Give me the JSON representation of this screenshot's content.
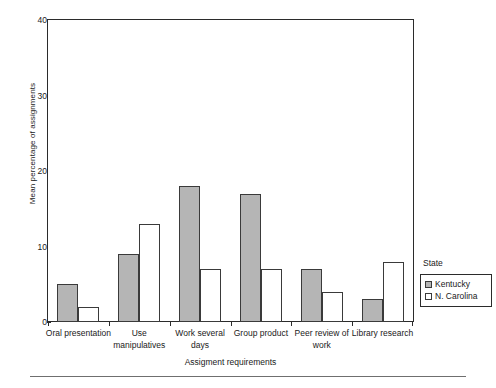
{
  "figure": {
    "clipped_title_fragment": "",
    "background": "#ffffff"
  },
  "chart_data": {
    "type": "bar",
    "title": "",
    "xlabel": "Assigment requirements",
    "ylabel": "Mean percentage of assignments",
    "categories": [
      "Oral presentation",
      "Use manipulatives",
      "Work several days",
      "Group product",
      "Peer review of work",
      "Library research"
    ],
    "series": [
      {
        "name": "Kentucky",
        "color": "#b5b5b5",
        "values": [
          5,
          9,
          18,
          17,
          7,
          3
        ]
      },
      {
        "name": "N. Carolina",
        "color": "#ffffff",
        "values": [
          2,
          13,
          7,
          7,
          4,
          8
        ]
      }
    ],
    "ylim": [
      0,
      40
    ],
    "yticks": [
      0,
      10,
      20,
      30,
      40
    ],
    "ytick_labels": [
      "0",
      "10",
      "20",
      "30",
      "40"
    ],
    "grid": false,
    "legend_position": "right",
    "legend_title": "State"
  },
  "legend": {
    "title": "State",
    "entries": [
      {
        "label": "Kentucky",
        "swatch": "ky"
      },
      {
        "label": "N. Carolina",
        "swatch": "nc"
      }
    ]
  }
}
